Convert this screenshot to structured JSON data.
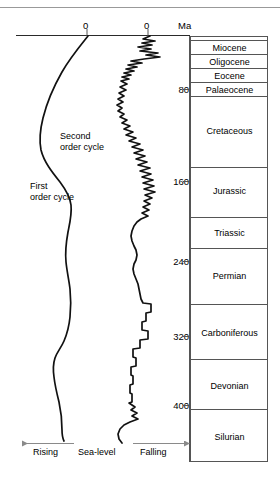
{
  "chart_data": {
    "type": "line",
    "title": "",
    "subtitle": "",
    "xlabel": "Sea-level",
    "ylabel": "Ma",
    "grid": false,
    "legend_position": "inline-annotations",
    "yaxis": {
      "label": "Ma",
      "unit": "Ma",
      "direction": "downward-increasing",
      "range": [
        0,
        462
      ],
      "ticks": [
        0,
        80,
        160,
        240,
        320,
        400
      ],
      "tick_labels": [
        "0",
        "80",
        "160",
        "240",
        "320",
        "400"
      ]
    },
    "xaxis": {
      "label": "Sea-level",
      "left_direction_label": "Rising",
      "right_direction_label": "Falling",
      "zero_labels": [
        "0",
        "0"
      ],
      "tick_labels": [
        "0",
        "0"
      ]
    },
    "series": [
      {
        "name": "First order cycle",
        "annotation": "First order cycle",
        "style": "smooth",
        "description": "Broad long-term sea-level curve; highstand (rising) bulge in the Cretaceous, falling toward the Palaeozoic"
      },
      {
        "name": "Second order cycle",
        "annotation": "Second order cycle",
        "style": "jagged",
        "description": "Higher-frequency sea-level oscillations superimposed on the first order cycle"
      }
    ],
    "annotations": [
      {
        "text": "First order cycle",
        "x": 34,
        "y": 186
      },
      {
        "text": "Second order cycle",
        "x": 60,
        "y": 136
      }
    ]
  },
  "timescale": {
    "header": "Ma",
    "column_label": "Ma",
    "units": [
      {
        "name": "Miocene",
        "top_ma": 0,
        "base_ma": 23
      },
      {
        "name": "Oligocene",
        "top_ma": 23,
        "base_ma": 34
      },
      {
        "name": "Eocene",
        "top_ma": 34,
        "base_ma": 56
      },
      {
        "name": "Palaeocene",
        "top_ma": 56,
        "base_ma": 66
      },
      {
        "name": "Cretaceous",
        "top_ma": 66,
        "base_ma": 145
      },
      {
        "name": "Jurassic",
        "top_ma": 145,
        "base_ma": 201
      },
      {
        "name": "Triassic",
        "top_ma": 201,
        "base_ma": 252
      },
      {
        "name": "Permian",
        "top_ma": 252,
        "base_ma": 299
      },
      {
        "name": "Carboniferous",
        "top_ma": 299,
        "base_ma": 359
      },
      {
        "name": "Devonian",
        "top_ma": 359,
        "base_ma": 419
      },
      {
        "name": "Silurian",
        "top_ma": 419,
        "base_ma": 444
      }
    ]
  },
  "axis": {
    "zero_left": "0",
    "zero_right": "0",
    "ma_header": "Ma",
    "ticks": [
      "80",
      "160",
      "240",
      "320",
      "400"
    ]
  },
  "footer": {
    "rising_label": "Rising",
    "sealevel_label": "Sea-level",
    "falling_label": "Falling"
  },
  "icons": {
    "arrow_left": "left-arrow-icon",
    "arrow_right": "right-arrow-icon"
  },
  "colors": {
    "ink": "#000000",
    "rule": "#999999",
    "box_border": "#555555"
  }
}
